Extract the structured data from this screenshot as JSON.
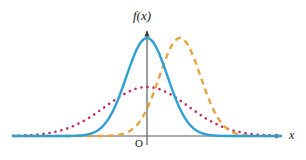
{
  "figure": {
    "title": "",
    "background_color": "#ffffff",
    "width": 306,
    "height": 160
  },
  "labels": {
    "y_axis": "f(x)",
    "x_axis": "x",
    "origin": "O"
  },
  "axes": {
    "color": "#555555",
    "x_axis_y_px": 136,
    "y_axis_x_px": 147,
    "x_axis_start_px": 18,
    "x_axis_end_px": 286,
    "y_axis_top_px": 26
  },
  "chart_data": {
    "type": "line",
    "title": "",
    "subtitle": "",
    "xlabel": "x",
    "ylabel": "f(x)",
    "xlim": [
      -6.5,
      6.5
    ],
    "ylim": [
      0,
      0.46
    ],
    "grid": false,
    "legend": "none",
    "annotations": [
      "O"
    ],
    "x_tick_labels": [],
    "y_tick_labels": [],
    "series": [
      {
        "name": "solid blue curve",
        "style": "solid",
        "color": "#2e9fd4",
        "line_width": 2.4,
        "distribution": "normal",
        "mean": 0,
        "sigma": 1,
        "peak_x": 0,
        "peak_y": 0.399,
        "x": [
          -6.5,
          -6,
          -5.5,
          -5,
          -4.5,
          -4,
          -3.5,
          -3,
          -2.5,
          -2,
          -1.5,
          -1,
          -0.5,
          0,
          0.5,
          1,
          1.5,
          2,
          2.5,
          3,
          3.5,
          4,
          4.5,
          5,
          5.5,
          6,
          6.5
        ],
        "values": [
          0.0,
          0.0,
          0.0,
          0.0,
          0.0,
          0.0001,
          0.0009,
          0.0044,
          0.0175,
          0.054,
          0.1295,
          0.242,
          0.3521,
          0.3989,
          0.3521,
          0.242,
          0.1295,
          0.054,
          0.0175,
          0.0044,
          0.0009,
          0.0001,
          0.0,
          0.0,
          0.0,
          0.0,
          0.0
        ]
      },
      {
        "name": "dotted magenta curve",
        "style": "dotted",
        "color": "#c62d62",
        "line_width": 2.6,
        "distribution": "normal",
        "mean": 0,
        "sigma": 2,
        "peak_x": 0,
        "peak_y": 0.199,
        "x": [
          -6.5,
          -6,
          -5.5,
          -5,
          -4.5,
          -4,
          -3.5,
          -3,
          -2.5,
          -2,
          -1.5,
          -1,
          -0.5,
          0,
          0.5,
          1,
          1.5,
          2,
          2.5,
          3,
          3.5,
          4,
          4.5,
          5,
          5.5,
          6,
          6.5
        ],
        "values": [
          0.0012,
          0.0022,
          0.0039,
          0.0066,
          0.0108,
          0.027,
          0.0388,
          0.0648,
          0.0913,
          0.1209,
          0.1506,
          0.176,
          0.1933,
          0.1995,
          0.1933,
          0.176,
          0.1506,
          0.1209,
          0.0913,
          0.0648,
          0.0388,
          0.027,
          0.0108,
          0.0066,
          0.0039,
          0.0022,
          0.0012
        ]
      },
      {
        "name": "dashed orange curve",
        "style": "dashed",
        "color": "#e8a33d",
        "line_width": 2.4,
        "distribution": "normal",
        "mean": 1.6,
        "sigma": 1,
        "peak_x": 1.6,
        "peak_y": 0.399,
        "x": [
          -6.5,
          -6,
          -5.5,
          -5,
          -4.5,
          -4,
          -3.5,
          -3,
          -2.5,
          -2,
          -1.5,
          -1,
          -0.5,
          0,
          0.5,
          1,
          1.5,
          2,
          2.5,
          3,
          3.5,
          4,
          4.5,
          5,
          5.5,
          6,
          6.5
        ],
        "values": [
          0.0,
          0.0,
          0.0,
          0.0,
          0.0,
          0.0,
          0.0,
          0.0,
          0.0,
          0.0001,
          0.0009,
          0.0044,
          0.0175,
          0.054,
          0.1295,
          0.242,
          0.3521,
          0.3989,
          0.3521,
          0.242,
          0.1295,
          0.054,
          0.0175,
          0.0044,
          0.0009,
          0.0001,
          0.0
        ]
      }
    ]
  }
}
